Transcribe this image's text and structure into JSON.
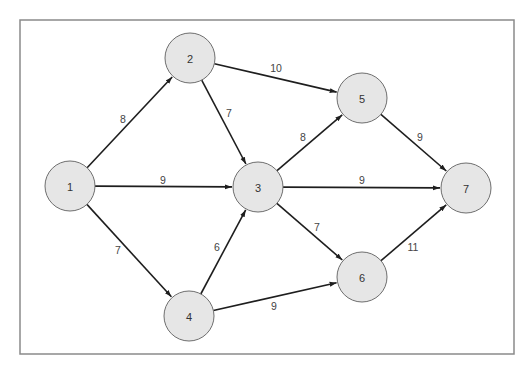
{
  "diagram": {
    "type": "directed-weighted-graph",
    "frame": {
      "x": 20,
      "y": 20,
      "width": 494,
      "height": 334
    },
    "colors": {
      "node_fill": "#e6e6e6",
      "node_stroke": "#6e6e6e",
      "edge": "#1e1e1e",
      "frame": "#8a8a8a",
      "text": "#333333"
    },
    "node_radius": 25,
    "nodes": [
      {
        "id": "1",
        "label": "1",
        "x": 70,
        "y": 186
      },
      {
        "id": "2",
        "label": "2",
        "x": 190,
        "y": 58
      },
      {
        "id": "3",
        "label": "3",
        "x": 258,
        "y": 187
      },
      {
        "id": "4",
        "label": "4",
        "x": 189,
        "y": 316
      },
      {
        "id": "5",
        "label": "5",
        "x": 362,
        "y": 98
      },
      {
        "id": "6",
        "label": "6",
        "x": 362,
        "y": 277
      },
      {
        "id": "7",
        "label": "7",
        "x": 466,
        "y": 188
      }
    ],
    "edges": [
      {
        "from": "1",
        "to": "2",
        "weight": "8",
        "label_x": 123,
        "label_y": 119
      },
      {
        "from": "1",
        "to": "3",
        "weight": "9",
        "label_x": 163,
        "label_y": 180
      },
      {
        "from": "1",
        "to": "4",
        "weight": "7",
        "label_x": 118,
        "label_y": 250
      },
      {
        "from": "2",
        "to": "3",
        "weight": "7",
        "label_x": 229,
        "label_y": 113
      },
      {
        "from": "2",
        "to": "5",
        "weight": "10",
        "label_x": 276,
        "label_y": 68
      },
      {
        "from": "4",
        "to": "3",
        "weight": "6",
        "label_x": 217,
        "label_y": 247
      },
      {
        "from": "3",
        "to": "5",
        "weight": "8",
        "label_x": 303,
        "label_y": 137
      },
      {
        "from": "3",
        "to": "7",
        "weight": "9",
        "label_x": 362,
        "label_y": 180
      },
      {
        "from": "3",
        "to": "6",
        "weight": "7",
        "label_x": 317,
        "label_y": 227
      },
      {
        "from": "4",
        "to": "6",
        "weight": "9",
        "label_x": 274,
        "label_y": 306
      },
      {
        "from": "5",
        "to": "7",
        "weight": "9",
        "label_x": 420,
        "label_y": 137
      },
      {
        "from": "6",
        "to": "7",
        "weight": "11",
        "label_x": 413,
        "label_y": 247
      }
    ]
  }
}
